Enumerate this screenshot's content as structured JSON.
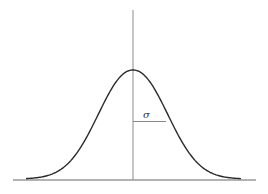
{
  "chart_data": {
    "type": "line",
    "title": "",
    "xlabel": "",
    "ylabel": "",
    "series": [
      {
        "name": "normal-density",
        "mean": 0,
        "std": 1,
        "x": [
          -3.2,
          -3.0,
          -2.5,
          -2.0,
          -1.5,
          -1.0,
          -0.5,
          0,
          0.5,
          1.0,
          1.5,
          2.0,
          2.5,
          3.0,
          3.2
        ],
        "values": [
          0.0024,
          0.0044,
          0.0175,
          0.054,
          0.1295,
          0.242,
          0.3521,
          0.3989,
          0.3521,
          0.242,
          0.1295,
          0.054,
          0.0175,
          0.0044,
          0.0024
        ]
      }
    ],
    "annotations": [
      {
        "text": "σ",
        "meaning": "standard deviation, horizontal segment from mean to inflection point"
      }
    ],
    "grid": false,
    "legend": null
  },
  "labels": {
    "sigma": "σ"
  },
  "colors": {
    "curve": "#2a2a2a",
    "axis": "#8a8a8a",
    "baseline": "#555555"
  }
}
